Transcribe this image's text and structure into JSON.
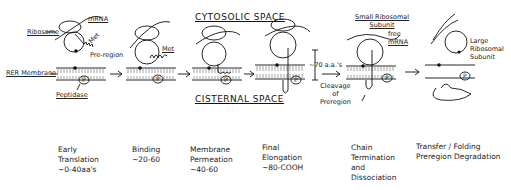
{
  "title_top": "CYTOSOLIC  SPACE",
  "title_bottom": "CISTERNAL  SPACE",
  "callouts": {
    "ribosome": "Ribosome",
    "mrna": "mRNA",
    "met": "Met",
    "pre_region": "Pre-region",
    "rer_membrane": "RER Membrane",
    "peptidase": "Peptidase",
    "met2": "Met",
    "aa70": "~70 a.a.'s",
    "cleavage": [
      "Cleavage",
      "of",
      "Preregion"
    ],
    "small_subunit": [
      "Small Ribosomal",
      "Subunit"
    ],
    "free_mrna": [
      "free",
      "mRNA"
    ],
    "large_subunit": [
      "Large",
      "Ribosomal",
      "Subunit"
    ],
    "peptidase_symbol": "P"
  },
  "stages": [
    {
      "lines": [
        "Early",
        "Translation",
        "~0-40aa's"
      ]
    },
    {
      "lines": [
        "Binding",
        "~20-60"
      ]
    },
    {
      "lines": [
        "Membrane",
        "Permeation",
        "~40-60"
      ]
    },
    {
      "lines": [
        "Final",
        "Elongation",
        "~80-COOH"
      ]
    },
    {
      "lines": [
        "Chain",
        "Termination",
        "and",
        "Dissociation"
      ]
    },
    {
      "lines": [
        "Transfer / Folding",
        "Preregion Degradation"
      ]
    }
  ]
}
